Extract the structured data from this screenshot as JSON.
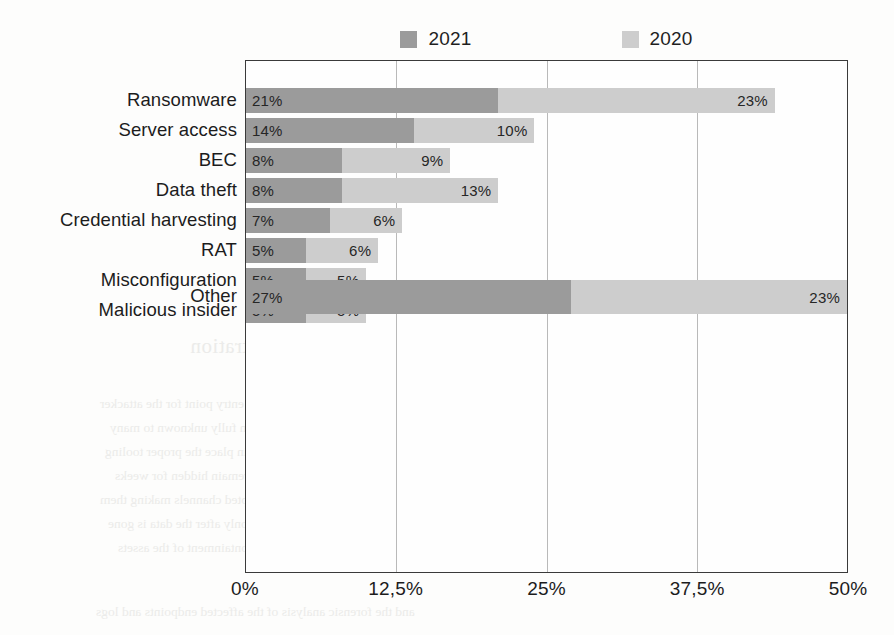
{
  "chart_data": {
    "type": "bar",
    "orientation": "horizontal",
    "stacked": true,
    "title": "",
    "subtitle": "",
    "xlabel": "",
    "ylabel": "",
    "xlim": [
      0,
      50
    ],
    "grid": true,
    "legend_position": "top",
    "axis_tick_labels": [
      "0%",
      "12,5%",
      "25%",
      "37,5%",
      "50%"
    ],
    "axis_tick_values": [
      0,
      12.5,
      25,
      37.5,
      50
    ],
    "categories": [
      "Ransomware",
      "Server access",
      "BEC",
      "Data theft",
      "Credential harvesting",
      "RAT",
      "Misconfiguration",
      "Malicious insider",
      "Other"
    ],
    "series": [
      {
        "name": "2021",
        "color": "#9b9b9b",
        "values": [
          21,
          14,
          8,
          8,
          7,
          5,
          5,
          5,
          27
        ],
        "labels": [
          "21%",
          "14%",
          "8%",
          "8%",
          "7%",
          "5%",
          "5%",
          "5%",
          "27%"
        ]
      },
      {
        "name": "2020",
        "color": "#cdcdcd",
        "values": [
          23,
          10,
          9,
          13,
          6,
          6,
          5,
          5,
          23
        ],
        "labels": [
          "23%",
          "10%",
          "9%",
          "13%",
          "6%",
          "6%",
          "5%",
          "5%",
          "23%"
        ]
      }
    ],
    "totals": [
      44,
      24,
      17,
      21,
      13,
      11,
      10,
      10,
      50
    ]
  },
  "legend": {
    "items": [
      {
        "label": "2021",
        "color": "#9b9b9b"
      },
      {
        "label": "2020",
        "color": "#cdcdcd"
      }
    ]
  }
}
